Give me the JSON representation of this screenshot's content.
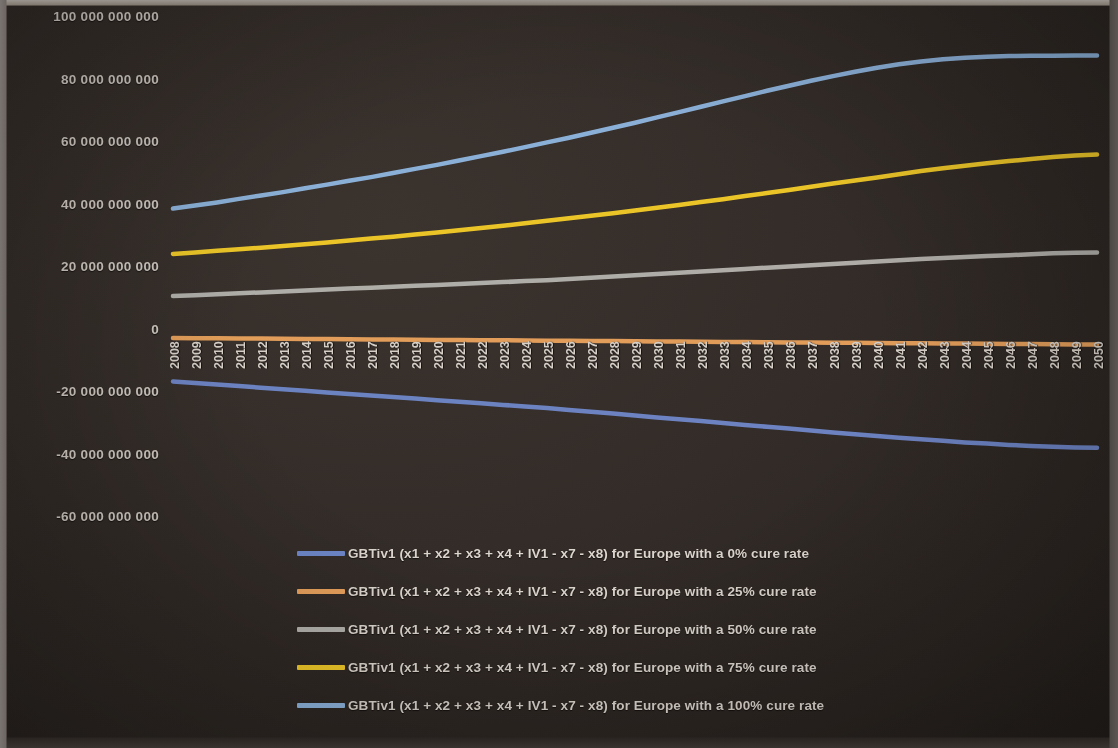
{
  "chart_data": {
    "type": "line",
    "title": "",
    "xlabel": "",
    "ylabel": "",
    "grid": false,
    "legend_position": "bottom",
    "ylim": [
      -60000000000,
      100000000000
    ],
    "ytick_labels": [
      "100 000 000 000",
      "80 000 000 000",
      "60 000 000 000",
      "40 000 000 000",
      "20 000 000 000",
      "0",
      "-20 000 000 000",
      "-40 000 000 000",
      "-60 000 000 000"
    ],
    "ytick_values": [
      100000000000,
      80000000000,
      60000000000,
      40000000000,
      20000000000,
      0,
      -20000000000,
      -40000000000,
      -60000000000
    ],
    "categories": [
      "2008",
      "2009",
      "2010",
      "2011",
      "2012",
      "2013",
      "2014",
      "2015",
      "2016",
      "2017",
      "2018",
      "2019",
      "2020",
      "2021",
      "2022",
      "2023",
      "2024",
      "2025",
      "2026",
      "2027",
      "2028",
      "2029",
      "2030",
      "2031",
      "2032",
      "2033",
      "2034",
      "2035",
      "2036",
      "2037",
      "2038",
      "2039",
      "2040",
      "2041",
      "2042",
      "2043",
      "2044",
      "2045",
      "2046",
      "2047",
      "2048",
      "2049",
      "2050"
    ],
    "series": [
      {
        "name": "GBTiv1 (x1 + x2 + x3 + x4 + IV1 - x7 - x8) for Europe with a 0% cure rate",
        "color": "#6E86C8",
        "values": [
          -16300000000,
          -16800000000,
          -17300000000,
          -17800000000,
          -18300000000,
          -18800000000,
          -19300000000,
          -19800000000,
          -20300000000,
          -20800000000,
          -21300000000,
          -21800000000,
          -22300000000,
          -22800000000,
          -23300000000,
          -23800000000,
          -24300000000,
          -24800000000,
          -25400000000,
          -26000000000,
          -26600000000,
          -27200000000,
          -27800000000,
          -28400000000,
          -29000000000,
          -29600000000,
          -30200000000,
          -30800000000,
          -31400000000,
          -32000000000,
          -32600000000,
          -33200000000,
          -33800000000,
          -34300000000,
          -34800000000,
          -35300000000,
          -35800000000,
          -36200000000,
          -36600000000,
          -36950000000,
          -37200000000,
          -37400000000,
          -37500000000
        ]
      },
      {
        "name": "GBTiv1 (x1 + x2 + x3 + x4 + IV1 - x7 - x8) for Europe with a 25% cure rate",
        "color": "#E8A15C",
        "values": [
          -2400000000,
          -2450000000,
          -2500000000,
          -2550000000,
          -2600000000,
          -2650000000,
          -2700000000,
          -2750000000,
          -2800000000,
          -2850000000,
          -2900000000,
          -2950000000,
          -3000000000,
          -3050000000,
          -3100000000,
          -3150000000,
          -3200000000,
          -3250000000,
          -3300000000,
          -3350000000,
          -3400000000,
          -3450000000,
          -3500000000,
          -3550000000,
          -3600000000,
          -3650000000,
          -3700000000,
          -3750000000,
          -3800000000,
          -3850000000,
          -3900000000,
          -3950000000,
          -4000000000,
          -4050000000,
          -4100000000,
          -4150000000,
          -4200000000,
          -4250000000,
          -4300000000,
          -4350000000,
          -4400000000,
          -4450000000,
          -4500000000
        ]
      },
      {
        "name": "GBTiv1 (x1 + x2 + x3 + x4 + IV1 - x7 - x8) for Europe with a 50% cure rate",
        "color": "#B4B2AD",
        "values": [
          11000000000,
          11300000000,
          11600000000,
          11900000000,
          12200000000,
          12500000000,
          12800000000,
          13100000000,
          13400000000,
          13700000000,
          14000000000,
          14300000000,
          14600000000,
          14900000000,
          15200000000,
          15500000000,
          15800000000,
          16100000000,
          16500000000,
          16900000000,
          17300000000,
          17700000000,
          18100000000,
          18500000000,
          18900000000,
          19300000000,
          19700000000,
          20100000000,
          20500000000,
          20900000000,
          21300000000,
          21700000000,
          22100000000,
          22500000000,
          22900000000,
          23200000000,
          23500000000,
          23800000000,
          24100000000,
          24400000000,
          24700000000,
          24900000000,
          25000000000
        ]
      },
      {
        "name": "GBTiv1 (x1 + x2 + x3 + x4 + IV1 - x7 - x8) for Europe with a 75% cure rate",
        "color": "#F2CB29",
        "values": [
          24500000000,
          25000000000,
          25500000000,
          26000000000,
          26500000000,
          27000000000,
          27600000000,
          28200000000,
          28800000000,
          29400000000,
          30000000000,
          30700000000,
          31400000000,
          32100000000,
          32800000000,
          33500000000,
          34300000000,
          35100000000,
          35900000000,
          36700000000,
          37500000000,
          38400000000,
          39300000000,
          40200000000,
          41100000000,
          42000000000,
          43000000000,
          44000000000,
          45000000000,
          46000000000,
          47000000000,
          48000000000,
          49000000000,
          50000000000,
          51000000000,
          51900000000,
          52700000000,
          53500000000,
          54200000000,
          54900000000,
          55500000000,
          56000000000,
          56300000000
        ]
      },
      {
        "name": "GBTiv1 (x1 + x2 + x3 + x4 + IV1 - x7 - x8) for Europe with a 100% cure rate",
        "color": "#8FB5DF",
        "values": [
          39000000000,
          40000000000,
          41000000000,
          42100000000,
          43200000000,
          44300000000,
          45500000000,
          46700000000,
          47900000000,
          49100000000,
          50400000000,
          51700000000,
          53000000000,
          54400000000,
          55800000000,
          57200000000,
          58700000000,
          60200000000,
          61700000000,
          63300000000,
          64900000000,
          66500000000,
          68200000000,
          69900000000,
          71600000000,
          73300000000,
          75000000000,
          76700000000,
          78300000000,
          79900000000,
          81400000000,
          82800000000,
          84100000000,
          85200000000,
          86100000000,
          86800000000,
          87300000000,
          87600000000,
          87800000000,
          87900000000,
          87950000000,
          88000000000,
          88000000000
        ]
      }
    ]
  },
  "legend": {
    "entries": [
      {
        "label": "GBTiv1 (x1 + x2 + x3 + x4 + IV1 - x7 - x8) for Europe with a 0% cure rate",
        "color": "#6E86C8"
      },
      {
        "label": "GBTiv1 (x1 + x2 + x3 + x4 + IV1 - x7 - x8) for Europe with a 25% cure rate",
        "color": "#E8A15C"
      },
      {
        "label": "GBTiv1 (x1 + x2 + x3 + x4 + IV1 - x7 - x8) for Europe with a 50% cure rate",
        "color": "#B4B2AD"
      },
      {
        "label": "GBTiv1 (x1 + x2 + x3 + x4 + IV1 - x7 - x8) for Europe with a 75% cure rate",
        "color": "#F2CB29"
      },
      {
        "label": "GBTiv1 (x1 + x2 + x3 + x4 + IV1 - x7 - x8) for Europe with a 100% cure rate",
        "color": "#8FB5DF"
      }
    ]
  },
  "theme": {
    "background": "#332c28",
    "tick_color": "#cfc8c0",
    "legend_text_color": "#ddd6ce"
  }
}
